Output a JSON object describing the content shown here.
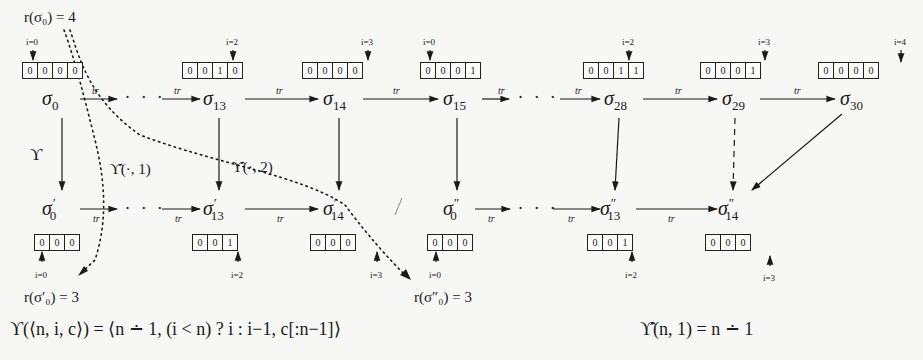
{
  "top_row": {
    "states": [
      {
        "id": "s0",
        "label": "σ",
        "sub": "0",
        "x": 42,
        "y": 88
      },
      {
        "id": "s13",
        "label": "σ",
        "sub": "13",
        "x": 203,
        "y": 88
      },
      {
        "id": "s14",
        "label": "σ",
        "sub": "14",
        "x": 323,
        "y": 88
      },
      {
        "id": "s15",
        "label": "σ",
        "sub": "15",
        "x": 443,
        "y": 88
      },
      {
        "id": "s28",
        "label": "σ",
        "sub": "28",
        "x": 604,
        "y": 88
      },
      {
        "id": "s29",
        "label": "σ",
        "sub": "29",
        "x": 722,
        "y": 88
      },
      {
        "id": "s30",
        "label": "σ",
        "sub": "30",
        "x": 840,
        "y": 88
      }
    ],
    "arrays": [
      {
        "id": "a0",
        "cells": [
          "0",
          "0",
          "0",
          "0"
        ],
        "x": 22,
        "y": 62,
        "pointer_label": "i=0",
        "pointer_x": 33
      },
      {
        "id": "a13",
        "cells": [
          "0",
          "0",
          "1",
          "0"
        ],
        "x": 182,
        "y": 62,
        "pointer_label": "i=2",
        "pointer_x": 233
      },
      {
        "id": "a14",
        "cells": [
          "0",
          "0",
          "0",
          "0"
        ],
        "x": 302,
        "y": 62,
        "pointer_label": "i=3",
        "pointer_x": 368
      },
      {
        "id": "a15",
        "cells": [
          "0",
          "0",
          "0",
          "1"
        ],
        "x": 420,
        "y": 62,
        "pointer_label": "i=0",
        "pointer_x": 430
      },
      {
        "id": "a28",
        "cells": [
          "0",
          "0",
          "1",
          "1"
        ],
        "x": 583,
        "y": 62,
        "pointer_label": "i=2",
        "pointer_x": 629
      },
      {
        "id": "a29",
        "cells": [
          "0",
          "0",
          "0",
          "1"
        ],
        "x": 700,
        "y": 62,
        "pointer_label": "i=3",
        "pointer_x": 765
      },
      {
        "id": "a30",
        "cells": [
          "0",
          "0",
          "0",
          "0"
        ],
        "x": 818,
        "y": 62,
        "pointer_label": "i=4",
        "pointer_x": 901
      }
    ],
    "transition_label": "tr",
    "ellipsis": "· · ·"
  },
  "bottom_row": {
    "states": [
      {
        "id": "p0",
        "label": "σ",
        "sub": "0",
        "sup": "′",
        "x": 42,
        "y": 208
      },
      {
        "id": "p13",
        "label": "σ",
        "sub": "13",
        "sup": "′",
        "x": 203,
        "y": 208
      },
      {
        "id": "p14",
        "label": "σ",
        "sub": "14",
        "sup": "′",
        "x": 323,
        "y": 208
      },
      {
        "id": "q0",
        "label": "σ",
        "sub": "0",
        "sup": "″",
        "x": 443,
        "y": 208
      },
      {
        "id": "q13",
        "label": "σ",
        "sub": "13",
        "sup": "″",
        "x": 604,
        "y": 208
      },
      {
        "id": "q14",
        "label": "σ",
        "sub": "14",
        "sup": "″",
        "x": 722,
        "y": 208
      }
    ],
    "arrays": [
      {
        "id": "b0",
        "cells": [
          "0",
          "0",
          "0"
        ],
        "x": 34,
        "y": 234,
        "pointer_label": "i=0",
        "pointer_x": 42
      },
      {
        "id": "b13",
        "cells": [
          "0",
          "0",
          "1"
        ],
        "x": 192,
        "y": 234,
        "pointer_label": "i=2",
        "pointer_x": 238
      },
      {
        "id": "b14",
        "cells": [
          "0",
          "0",
          "0"
        ],
        "x": 310,
        "y": 234,
        "pointer_label": "i=3",
        "pointer_x": 377
      },
      {
        "id": "c0",
        "cells": [
          "0",
          "0",
          "0"
        ],
        "x": 427,
        "y": 234,
        "pointer_label": "i=0",
        "pointer_x": 436
      },
      {
        "id": "c13",
        "cells": [
          "0",
          "0",
          "1"
        ],
        "x": 587,
        "y": 234,
        "pointer_label": "i=2",
        "pointer_x": 632
      },
      {
        "id": "c14",
        "cells": [
          "0",
          "0",
          "0"
        ],
        "x": 705,
        "y": 234,
        "pointer_label": "i=3",
        "pointer_x": 770
      }
    ]
  },
  "annotations": {
    "r_sigma0": "r(σ₀) = 4",
    "r_sigma0_prime": "r(σ′₀) = 3",
    "r_sigma0_dprime": "r(σ″₀) = 3",
    "upsilon": "ϒ",
    "upsilon_hat_1": "ϒ̂(·, 1)",
    "upsilon_hat_2": "ϒ̂(·, 2)",
    "separator": "/"
  },
  "formulas": {
    "upsilon_def": "ϒ(⟨n, i, c⟩) = ⟨n ∸ 1, (i < n) ? i : i−1, c[:n−1]⟩",
    "upsilon_hat_def": "ϒ̂(n, 1) = n ∸ 1"
  },
  "colors": {
    "ink": "#1a1a1a",
    "background": "#f7f7f5"
  }
}
